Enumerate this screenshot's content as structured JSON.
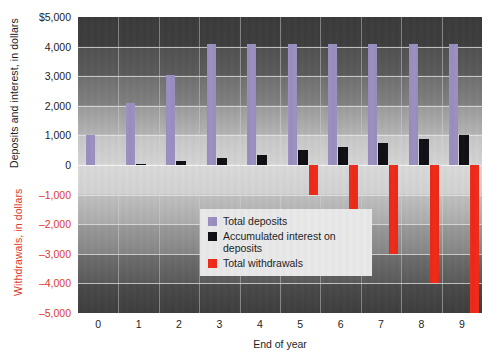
{
  "chart_data": {
    "type": "bar",
    "title": "",
    "xlabel": "End of year",
    "ylabel_top": "Deposits and interest, in dollars",
    "ylabel_bottom": "Withdrawals, in dollars",
    "categories": [
      "0",
      "1",
      "2",
      "3",
      "4",
      "5",
      "6",
      "7",
      "8",
      "9"
    ],
    "ylim": [
      -5000,
      5000
    ],
    "ytick_values": [
      5000,
      4000,
      3000,
      2000,
      1000,
      0,
      -1000,
      -2000,
      -3000,
      -4000,
      -5000
    ],
    "ytick_labels": [
      "$5,000",
      "4,000",
      "3,000",
      "2,000",
      "1,000",
      "0",
      "–1,000",
      "–2,000",
      "–3,000",
      "–4,000",
      "–5,000"
    ],
    "grid": true,
    "legend_position": "inside-lower-left",
    "series": [
      {
        "name": "Total deposits",
        "color": "#9a8fc0",
        "values": [
          1000,
          2100,
          3050,
          4100,
          4100,
          4100,
          4100,
          4100,
          4100,
          4100
        ]
      },
      {
        "name": "Accumulated interest on deposits",
        "color": "#101014",
        "values": [
          0,
          50,
          150,
          250,
          350,
          500,
          620,
          750,
          880,
          1030
        ]
      },
      {
        "name": "Total withdrawals",
        "color": "#ee2a18",
        "values": [
          0,
          0,
          0,
          0,
          0,
          -1000,
          -2000,
          -3000,
          -4000,
          -5000
        ]
      }
    ]
  },
  "legend": {
    "items": [
      {
        "label": "Total deposits",
        "swatch": "sw-deposits",
        "name": "legend-swatch-total-deposits"
      },
      {
        "label": "Accumulated interest on deposits",
        "swatch": "sw-interest",
        "name": "legend-swatch-accumulated-interest"
      },
      {
        "label": "Total withdrawals",
        "swatch": "sw-withdrawals",
        "name": "legend-swatch-total-withdrawals"
      }
    ]
  }
}
